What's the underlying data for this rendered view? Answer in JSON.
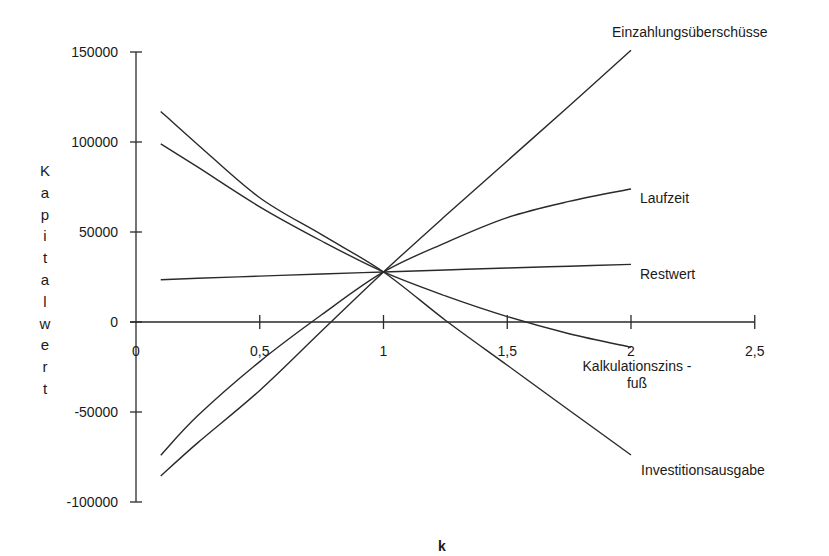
{
  "chart_data": {
    "type": "line",
    "title": "",
    "xlabel": "Kalkulationszins - fuß",
    "xlabel_lines": [
      "Kalkulationszins -",
      "fuß"
    ],
    "ylabel": "Kapitalwert",
    "bottom_label": "k",
    "xlim": [
      0,
      2.5
    ],
    "ylim": [
      -100000,
      150000
    ],
    "x_ticks": [
      0,
      0.5,
      1,
      1.5,
      2,
      2.5
    ],
    "x_tick_labels": [
      "0",
      "0,5",
      "1",
      "1,5",
      "2",
      "2,5"
    ],
    "y_ticks": [
      150000,
      100000,
      50000,
      0,
      -50000,
      -100000
    ],
    "y_tick_labels": [
      "150000",
      "100000",
      "50000",
      "0",
      "-50000",
      "-100000"
    ],
    "grid": false,
    "legend": "inline labels at line ends",
    "x": [
      0.1,
      0.25,
      0.5,
      0.75,
      1.0,
      1.25,
      1.5,
      1.75,
      2.0
    ],
    "series": [
      {
        "name": "Einzahlungsüberschüsse",
        "values": [
          -85500,
          -67000,
          -38000,
          -5000,
          27800,
          59000,
          89500,
          120000,
          151000
        ]
      },
      {
        "name": "Laufzeit",
        "values": [
          -74000,
          -52000,
          -22000,
          4000,
          27800,
          44000,
          58000,
          67000,
          73900
        ]
      },
      {
        "name": "Restwert",
        "values": [
          23500,
          24300,
          25500,
          26700,
          27800,
          28900,
          30000,
          31000,
          32000
        ]
      },
      {
        "name": "Investitionsausgabe",
        "values": [
          117000,
          98500,
          69000,
          48500,
          27800,
          1000,
          -24000,
          -49000,
          -73900
        ]
      },
      {
        "name": "",
        "values": [
          99000,
          86000,
          64000,
          45000,
          27800,
          14500,
          3000,
          -6500,
          -14000
        ]
      }
    ]
  },
  "labels": {
    "y_letters": [
      "K",
      "a",
      "p",
      "i",
      "t",
      "a",
      "l",
      "w",
      "e",
      "r",
      "t"
    ],
    "series_label_positions": [
      {
        "text": "Einzahlungsüberschüsse",
        "x": 612,
        "y": 37
      },
      {
        "text": "Laufzeit",
        "x": 640,
        "y": 203
      },
      {
        "text": "Restwert",
        "x": 640,
        "y": 279
      },
      {
        "text": "Investitionsausgabe",
        "x": 641,
        "y": 475
      }
    ]
  },
  "style": {
    "line_color": "#2a2a2a",
    "text_color": "#1a1a1a",
    "background": "#ffffff"
  }
}
